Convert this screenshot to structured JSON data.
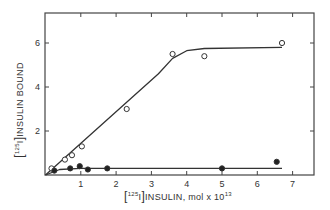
{
  "chart_data": {
    "type": "scatter",
    "title": "",
    "xlabel": "[125I]INSULIN, mol x 10^13",
    "ylabel": "[125I]INSULIN BOUND",
    "xlim": [
      0,
      7.6
    ],
    "ylim": [
      0,
      7.2
    ],
    "x_ticks": [
      1,
      2,
      3,
      4,
      5,
      6,
      7
    ],
    "y_ticks": [
      2,
      4,
      6
    ],
    "grid": false,
    "legend": null,
    "series": [
      {
        "name": "open circles",
        "marker": "open-circle",
        "points": [
          [
            0.17,
            0.3
          ],
          [
            0.55,
            0.7
          ],
          [
            0.75,
            0.9
          ],
          [
            1.03,
            1.3
          ],
          [
            2.3,
            3.0
          ],
          [
            3.6,
            5.5
          ],
          [
            4.5,
            5.4
          ],
          [
            6.7,
            6.0
          ]
        ],
        "fit_curve": [
          [
            0,
            0
          ],
          [
            3.2,
            4.6
          ],
          [
            3.6,
            5.3
          ],
          [
            4.0,
            5.65
          ],
          [
            4.5,
            5.75
          ],
          [
            6.7,
            5.8
          ]
        ]
      },
      {
        "name": "filled circles",
        "marker": "filled-circle",
        "points": [
          [
            0.25,
            0.2
          ],
          [
            0.7,
            0.3
          ],
          [
            0.97,
            0.4
          ],
          [
            1.2,
            0.25
          ],
          [
            1.75,
            0.3
          ],
          [
            5.0,
            0.3
          ],
          [
            6.55,
            0.6
          ]
        ],
        "fit_curve": [
          [
            0,
            0
          ],
          [
            0.4,
            0.25
          ],
          [
            1.0,
            0.3
          ],
          [
            6.7,
            0.3
          ]
        ]
      }
    ]
  },
  "labels": {
    "x_axis": {
      "sup": "125",
      "iso": "I",
      "rest": "INSULIN, mol x 10",
      "exp": "13"
    },
    "y_axis": {
      "sup": "125",
      "iso": "I",
      "rest": "INSULIN  BOUND"
    },
    "x_tick_labels": [
      "1",
      "2",
      "3",
      "4",
      "5",
      "6",
      "7"
    ],
    "y_tick_labels": [
      "2",
      "4",
      "6"
    ]
  }
}
